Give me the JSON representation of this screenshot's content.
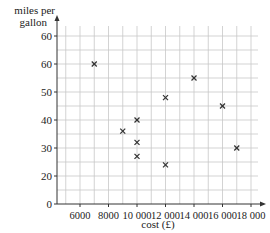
{
  "chart_data": {
    "type": "scatter",
    "title": "",
    "xlabel": "cost (£)",
    "ylabel": "miles per gallon",
    "ylabel_lines": [
      "miles per",
      "gallon"
    ],
    "x_ticks": [
      {
        "value": 6000,
        "label": "6000"
      },
      {
        "value": 8000,
        "label": "8000"
      },
      {
        "value": 10000,
        "label": "10 000"
      },
      {
        "value": 12000,
        "label": "12 000"
      },
      {
        "value": 14000,
        "label": "14 000"
      },
      {
        "value": 16000,
        "label": "16 000"
      },
      {
        "value": 18000,
        "label": "18 000"
      }
    ],
    "y_ticks": [
      "0",
      "20",
      "30",
      "40",
      "50",
      "60",
      "60"
    ],
    "y_axis_note": "axis is broken between 0 and 20; top tick is printed as 60",
    "grid": true,
    "marker": "x",
    "points": [
      {
        "x": 7000,
        "y": 60
      },
      {
        "x": 9000,
        "y": 36
      },
      {
        "x": 10000,
        "y": 40
      },
      {
        "x": 10000,
        "y": 32
      },
      {
        "x": 10000,
        "y": 27
      },
      {
        "x": 12000,
        "y": 48
      },
      {
        "x": 12000,
        "y": 24
      },
      {
        "x": 14000,
        "y": 55
      },
      {
        "x": 16000,
        "y": 45
      },
      {
        "x": 17000,
        "y": 30
      }
    ],
    "xlim": [
      4400,
      19000
    ],
    "colors": {
      "grid": "#c8c8c8",
      "axis": "#333333",
      "marker": "#333333"
    }
  }
}
